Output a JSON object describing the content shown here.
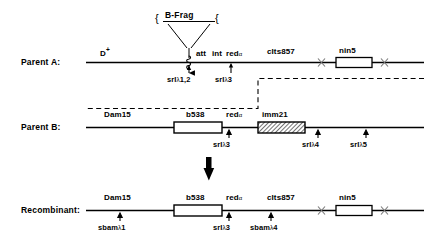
{
  "figure": {
    "line_color": "#000000",
    "dashed_color": "#000000",
    "box_fill": "#ffffff",
    "hatch_fill": "#ffffff"
  },
  "callout": {
    "label": "B-Frag",
    "left_brace": "{",
    "right_brace": "{"
  },
  "rows": [
    {
      "id": "parent-a",
      "title": "Parent A:",
      "genes": [
        {
          "name": "D",
          "sup": "+",
          "label": "D"
        },
        {
          "name": "att",
          "label": "att"
        },
        {
          "name": "int",
          "label": "int"
        },
        {
          "name": "red-alpha",
          "label": "red",
          "alpha": "α"
        },
        {
          "name": "cIts857",
          "label": "cIts857"
        },
        {
          "name": "nin5",
          "label": "nin5"
        }
      ],
      "markers": [
        {
          "name": "srI-lambda-1-2",
          "prefix": "sr",
          "bracket": "I",
          "lambda": "λ",
          "num": "1,2"
        },
        {
          "name": "srI-lambda-3",
          "prefix": "sr",
          "bracket": "I",
          "lambda": "λ",
          "num": "3"
        }
      ]
    },
    {
      "id": "parent-b",
      "title": "Parent B:",
      "genes": [
        {
          "name": "Dam15",
          "label": "Dam15"
        },
        {
          "name": "b538",
          "label": "b538"
        },
        {
          "name": "red-alpha",
          "label": "red",
          "alpha": "α"
        },
        {
          "name": "imm21",
          "label": "imm21"
        }
      ],
      "markers": [
        {
          "name": "srI-lambda-3",
          "prefix": "sr",
          "bracket": "I",
          "lambda": "λ",
          "num": "3"
        },
        {
          "name": "srI-lambda-4",
          "prefix": "sr",
          "bracket": "I",
          "lambda": "λ",
          "num": "4"
        },
        {
          "name": "srI-lambda-5",
          "prefix": "sr",
          "bracket": "I",
          "lambda": "λ",
          "num": "5"
        }
      ]
    },
    {
      "id": "recombinant",
      "title": "Recombinant:",
      "genes": [
        {
          "name": "Dam15",
          "label": "Dam15"
        },
        {
          "name": "b538",
          "label": "b538"
        },
        {
          "name": "red-alpha",
          "label": "red",
          "alpha": "α"
        },
        {
          "name": "cIts857",
          "label": "cIts857"
        },
        {
          "name": "nin5",
          "label": "nin5"
        }
      ],
      "markers": [
        {
          "name": "sbam-lambda-1",
          "prefix": "sbam",
          "bracket": "",
          "lambda": "λ",
          "num": "1"
        },
        {
          "name": "srI-lambda-3",
          "prefix": "sr",
          "bracket": "I",
          "lambda": "λ",
          "num": "3"
        },
        {
          "name": "sbam-lambda-4",
          "prefix": "sbam",
          "bracket": "",
          "lambda": "λ",
          "num": "4"
        }
      ]
    }
  ],
  "text": {
    "parent_a_title": "Parent A:",
    "parent_b_title": "Parent B:",
    "recombinant_title": "Recombinant:",
    "bfrag": "B-Frag",
    "D": "D",
    "D_sup": "+",
    "att": "att",
    "int": "int",
    "red": "red",
    "alpha": "α",
    "cIts857": "cIts857",
    "nin5": "nin5",
    "Dam15": "Dam15",
    "b538": "b538",
    "imm21": "imm21",
    "sr": "sr",
    "srI": "srI",
    "sbam": "sbam",
    "lambda": "λ",
    "n12": "1,2",
    "n3": "3",
    "n4": "4",
    "n5": "5",
    "n1": "1",
    "brace_left": "{",
    "brace_right": "{"
  }
}
